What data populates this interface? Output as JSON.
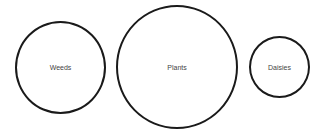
{
  "diagram": {
    "type": "separate-sets",
    "circles": [
      {
        "label": "Weeds",
        "size": "medium"
      },
      {
        "label": "Plants",
        "size": "large"
      },
      {
        "label": "Daisies",
        "size": "small"
      }
    ]
  }
}
